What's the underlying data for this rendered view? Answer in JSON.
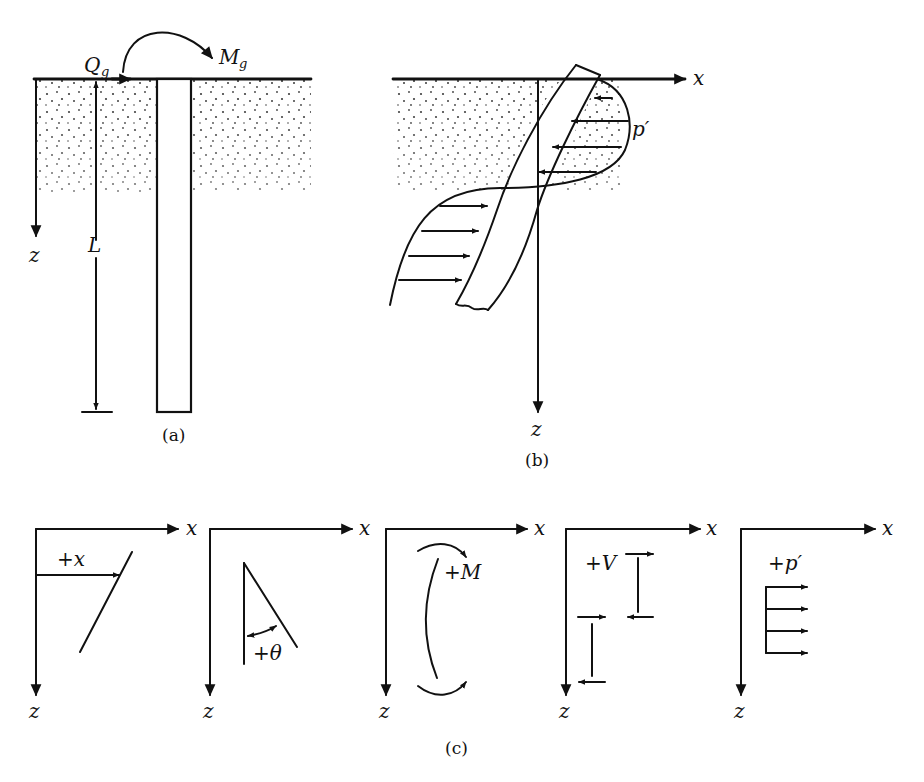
{
  "figure": {
    "panel_a": {
      "caption": "(a)",
      "load_label": "Q",
      "load_subscript": "g",
      "moment_label": "M",
      "moment_subscript": "g",
      "depth_axis_label": "z",
      "length_label": "L"
    },
    "panel_b": {
      "caption": "(b)",
      "x_axis_label": "x",
      "z_axis_label": "z",
      "pressure_label": "p′"
    },
    "panel_c": {
      "caption": "(c)",
      "sign_conventions": [
        {
          "name": "deflection",
          "label": "+x",
          "x_axis_label": "x",
          "z_axis_label": "z"
        },
        {
          "name": "slope",
          "label": "+θ",
          "x_axis_label": "x",
          "z_axis_label": "z"
        },
        {
          "name": "moment",
          "label": "+M",
          "x_axis_label": "x",
          "z_axis_label": "z"
        },
        {
          "name": "shear",
          "label": "+V",
          "x_axis_label": "x",
          "z_axis_label": "z"
        },
        {
          "name": "soil-reaction",
          "label": "+p′",
          "x_axis_label": "x",
          "z_axis_label": "z"
        }
      ]
    }
  }
}
